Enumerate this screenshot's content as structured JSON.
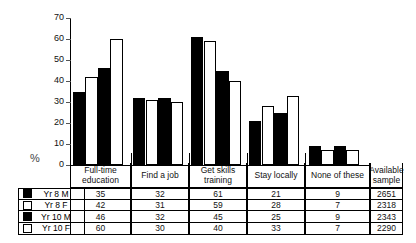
{
  "chart_data": {
    "type": "bar",
    "title": "",
    "xlabel": "",
    "ylabel": "%",
    "ylim": [
      0,
      70
    ],
    "yticks": [
      0,
      10,
      20,
      30,
      40,
      50,
      60,
      70
    ],
    "grid": false,
    "legend_position": "table-left-column",
    "categories": [
      "Full-time education",
      "Find a job",
      "Get skills training",
      "Stay locally",
      "None of these"
    ],
    "series": [
      {
        "name": "Yr 8 M",
        "color": "#000000",
        "values": [
          35,
          32,
          61,
          21,
          9
        ]
      },
      {
        "name": "Yr 8 F",
        "color": "#ffffff",
        "values": [
          42,
          31,
          59,
          28,
          7
        ]
      },
      {
        "name": "Yr 10 M",
        "color": "#000000",
        "values": [
          46,
          32,
          45,
          25,
          9
        ]
      },
      {
        "name": "Yr 10 F",
        "color": "#ffffff",
        "values": [
          60,
          30,
          40,
          33,
          7
        ]
      }
    ],
    "extra_column": {
      "header": "Available sample",
      "values": [
        2651,
        2318,
        2343,
        2290
      ]
    }
  },
  "table": {
    "headers": [
      "Full-time education",
      "Find a job",
      "Get skills training",
      "Stay locally",
      "None of these",
      "Available sample"
    ],
    "rows": [
      {
        "label": "Yr 8 M",
        "swatch": "black",
        "cells": [
          "35",
          "32",
          "61",
          "21",
          "9",
          "2651"
        ]
      },
      {
        "label": "Yr 8 F",
        "swatch": "white",
        "cells": [
          "42",
          "31",
          "59",
          "28",
          "7",
          "2318"
        ]
      },
      {
        "label": "Yr 10 M",
        "swatch": "black",
        "cells": [
          "46",
          "32",
          "45",
          "25",
          "9",
          "2343"
        ]
      },
      {
        "label": "Yr 10 F",
        "swatch": "white",
        "cells": [
          "60",
          "30",
          "40",
          "33",
          "7",
          "2290"
        ]
      }
    ]
  },
  "axis": {
    "unit_label": "%",
    "labels": [
      "70",
      "60",
      "50",
      "40",
      "30",
      "20",
      "10",
      "0"
    ]
  }
}
